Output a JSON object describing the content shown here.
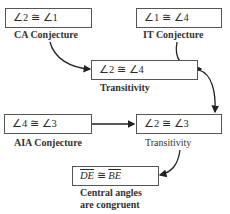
{
  "nodes": [
    {
      "id": "n1",
      "statement": "∠2 ≅ ∠1",
      "reason": "CA Conjecture"
    },
    {
      "id": "n2",
      "statement": "∠1 ≅ ∠4",
      "reason": "IT Conjecture"
    },
    {
      "id": "n3",
      "statement": "∠2 ≅ ∠4",
      "reason": "Transitivity"
    },
    {
      "id": "n4",
      "statement": "∠4 ≅ ∠3",
      "reason": "AIA Conjecture"
    },
    {
      "id": "n5",
      "statement": "∠2 ≅ ∠3",
      "reason": "Transitivity"
    },
    {
      "id": "n6",
      "statement_left": "DE",
      "statement_op": " ≅ ",
      "statement_right": "BE",
      "reason_line1": "Central angles",
      "reason_line2": "are congruent"
    }
  ],
  "edges": [
    {
      "from": "n1",
      "to": "n3"
    },
    {
      "from": "n2",
      "to": "n3"
    },
    {
      "from": "n3",
      "to": "n5"
    },
    {
      "from": "n4",
      "to": "n5"
    },
    {
      "from": "n5",
      "to": "n6"
    }
  ]
}
